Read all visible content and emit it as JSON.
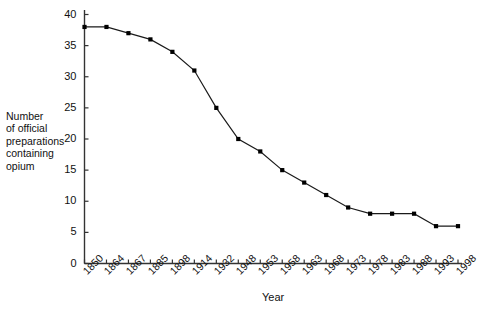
{
  "chart_data": {
    "type": "line",
    "title": "",
    "xlabel": "Year",
    "ylabel": "Number\nof official\npreparations\ncontaining\nopium",
    "categories": [
      "1850",
      "1864",
      "1867",
      "1885",
      "1898",
      "1914",
      "1932",
      "1948",
      "1953",
      "1958",
      "1963",
      "1968",
      "1973",
      "1978",
      "1983",
      "1988",
      "1993",
      "1998"
    ],
    "values": [
      38,
      38,
      37,
      36,
      34,
      31,
      25,
      20,
      18,
      15,
      13,
      11,
      9,
      8,
      8,
      8,
      6,
      6
    ],
    "ylim": [
      0,
      40
    ],
    "yticks": [
      "0",
      "5",
      "10",
      "15",
      "20",
      "25",
      "30",
      "35",
      "40"
    ],
    "ytick_values": [
      0,
      5,
      10,
      15,
      20,
      25,
      30,
      35,
      40
    ],
    "grid": false,
    "legend": "none",
    "marker": "filled-square",
    "line_color": "#1a1a1a",
    "marker_color": "#000000",
    "axis_color": "#333333",
    "background_color": "#ffffff"
  },
  "axes": {
    "y_axis_name": "y-axis",
    "x_axis_name": "x-axis"
  }
}
